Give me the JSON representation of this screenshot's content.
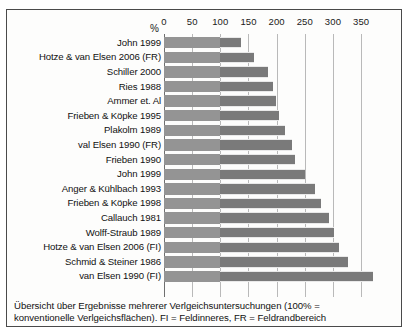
{
  "chart_data": {
    "type": "bar",
    "orientation": "horizontal",
    "title": "",
    "xlabel": "%",
    "ylabel": "",
    "xlim": [
      0,
      380
    ],
    "grid": true,
    "legend_position": "none",
    "xticks": [
      0,
      50,
      100,
      150,
      200,
      250,
      300,
      350
    ],
    "reference_line": 100,
    "categories": [
      "John 1999",
      "Hotze & van Elsen 2006 (FR)",
      "Schiller 2000",
      "Ries 1988",
      "Ammer et. Al",
      "Frieben & Köpke 1995",
      "Plakolm 1989",
      "val Elsen 1990 (FR)",
      "Frieben 1990",
      "John 1999",
      "Anger & Kühlbach 1993",
      "Frieben & Köpke 1998",
      "Callauch 1981",
      "Wolff-Straub 1989",
      "Hotze & van Elsen 2006 (FI)",
      "Schmid & Steiner 1986",
      "van Elsen 1990 (FI)"
    ],
    "values": [
      137,
      160,
      185,
      194,
      198,
      205,
      214,
      228,
      232,
      250,
      268,
      278,
      293,
      302,
      310,
      327,
      371
    ],
    "values_unit": "%",
    "baseline_value": 100
  },
  "axis": {
    "percent_symbol": "%",
    "tick_labels": [
      "0",
      "50",
      "100",
      "150",
      "200",
      "250",
      "300",
      "350"
    ]
  },
  "caption": {
    "line1": "Übersicht über Ergebnisse mehrerer Verlgeichsuntersuchungen (100% =",
    "line2": "konventionelle Verlgeichsflächen). FI = Feldinneres, FR = Feldrandbereich"
  },
  "colors": {
    "bar_fill": "#7a7a7a",
    "bar_fill_base": "#949494",
    "gridline": "#b9b9b9",
    "axis": "#6f6f6f",
    "frame": "#4a4a4a",
    "background": "#fdfdfc",
    "text": "#111111"
  }
}
